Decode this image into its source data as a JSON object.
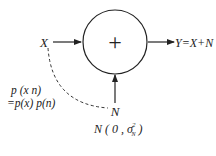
{
  "diagram": {
    "type": "additive-noise-channel",
    "nodes": {
      "input": "X",
      "adder_symbol": "+",
      "noise": "N",
      "output": "Y=X+N"
    },
    "annotations": {
      "joint_line1": "p (x n)",
      "joint_line2": "=p(x) p(n)",
      "noise_dist_prefix": "N ( 0 , σ",
      "noise_dist_sup": "2",
      "noise_dist_sub": "N",
      "noise_dist_suffix": " )"
    },
    "edges": [
      {
        "from": "X",
        "to": "adder",
        "style": "arrow"
      },
      {
        "from": "N",
        "to": "adder",
        "style": "arrow"
      },
      {
        "from": "adder",
        "to": "Y",
        "style": "arrow"
      },
      {
        "from": "X",
        "to": "N",
        "style": "dashed-curve"
      }
    ]
  }
}
